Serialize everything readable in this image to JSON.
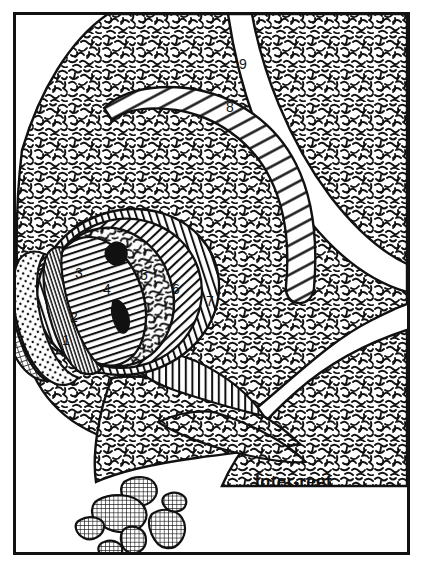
{
  "figure": {
    "name": "reef-facies-map",
    "background_color": "#ffffff",
    "ink_color": "#111111",
    "frame": {
      "name": "border-frame",
      "x": 13,
      "y": 12,
      "width": 396,
      "height": 542,
      "stroke_width": 3
    }
  },
  "labels": {
    "zone_1": "1",
    "zone_2": "2",
    "zone_3": "3",
    "zone_4": "4",
    "zone_5": "5",
    "zone_6": "6",
    "zone_7": "7",
    "zone_8": "8",
    "zone_9": "9",
    "inter_reef": "Inter-reef"
  },
  "label_positions": {
    "zone_1": {
      "x": 62,
      "y": 345
    },
    "zone_2": {
      "x": 70,
      "y": 320
    },
    "zone_3": {
      "x": 75,
      "y": 277
    },
    "zone_4": {
      "x": 103,
      "y": 292
    },
    "zone_5": {
      "x": 138,
      "y": 278
    },
    "zone_6": {
      "x": 173,
      "y": 292
    },
    "zone_7": {
      "x": 207,
      "y": 305
    },
    "zone_8": {
      "x": 230,
      "y": 110
    },
    "zone_9": {
      "x": 243,
      "y": 67
    },
    "inter_reef": {
      "x": 255,
      "y": 486
    }
  },
  "patterns": {
    "squiggle": {
      "name": "squiggle-texture",
      "description": "dense irregular worm-like squiggles"
    },
    "dotted": {
      "name": "dotted-stipple",
      "description": "regular dot stipple"
    },
    "crosshatch": {
      "name": "crosshatch-grid",
      "description": "fine orthogonal grid"
    },
    "horizontal": {
      "name": "horizontal-lines",
      "description": "horizontal rule lines"
    },
    "vertical": {
      "name": "vertical-lines",
      "description": "vertical rule lines"
    },
    "diagonal_dense": {
      "name": "dense-diagonal-lines",
      "description": "closely spaced diagonal lines"
    },
    "diagonal_wide": {
      "name": "wide-diagonal-lines",
      "description": "widely spaced diagonal lines"
    },
    "solid_black": {
      "name": "solid-black-fill",
      "description": "solid black patches"
    }
  },
  "zone_patterns": {
    "zone_1": "crosshatch-grid",
    "zone_2": "dotted-stipple",
    "zone_3": "fine-vertical-tick-band",
    "zone_4": "horizontal-lines",
    "zone_5": "squiggle-texture",
    "zone_6": "dense-diagonal-lines",
    "zone_7": "vertical-lines",
    "zone_8": "wide-diagonal-lines",
    "zone_9": "squiggle-texture"
  },
  "debris_blocks": {
    "name": "detached-reef-blocks",
    "pattern": "crosshatch-grid",
    "count": 7
  }
}
